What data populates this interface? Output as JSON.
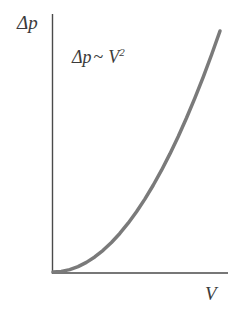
{
  "figure": {
    "background_color": "#ffffff",
    "axis_color": "#4a4a4a",
    "curve_color": "#7a7a7a",
    "text_color": "#3b3b3b",
    "y_axis_label": "Δp",
    "x_axis_label": "V",
    "annotation": {
      "base": "Δp",
      "relation": "~",
      "variable": "V",
      "exponent": "2",
      "full_text": "Δp ~ V²"
    }
  },
  "chart_data": {
    "type": "line",
    "title": "",
    "subtitle": "",
    "xlabel": "V",
    "ylabel": "Δp",
    "grid": false,
    "legend": false,
    "legend_position": "none",
    "annotations": [
      {
        "text": "Δp ~ V²",
        "x": 0.22,
        "y": 0.88
      }
    ],
    "xlim": [
      0,
      1
    ],
    "ylim": [
      0,
      1
    ],
    "xticks": [],
    "yticks": [],
    "xticklabels": [],
    "yticklabels": [],
    "relationship": "Δp ∝ V²",
    "series": [
      {
        "name": "Δp ~ V²",
        "color": "#7a7a7a",
        "linewidth": 3.5,
        "x": [
          0.0,
          0.05,
          0.1,
          0.15,
          0.2,
          0.25,
          0.3,
          0.35,
          0.4,
          0.45,
          0.5,
          0.55,
          0.6,
          0.65,
          0.7,
          0.75,
          0.8,
          0.85,
          0.9,
          0.95,
          1.0
        ],
        "y": [
          0.0,
          0.0025,
          0.01,
          0.0225,
          0.04,
          0.0625,
          0.09,
          0.1225,
          0.16,
          0.2025,
          0.25,
          0.3025,
          0.36,
          0.4225,
          0.49,
          0.5625,
          0.64,
          0.7225,
          0.81,
          0.9025,
          1.0
        ]
      }
    ]
  }
}
